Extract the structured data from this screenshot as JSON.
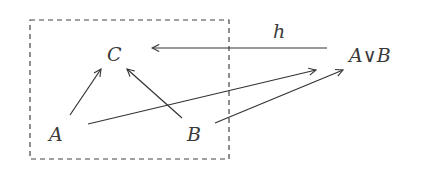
{
  "diagram": {
    "type": "commutative-diagram",
    "nodes": [
      {
        "id": "C",
        "label": "C",
        "x": 116,
        "y": 61
      },
      {
        "id": "A",
        "label": "A",
        "x": 57,
        "y": 140
      },
      {
        "id": "B",
        "label": "B",
        "x": 195,
        "y": 140
      },
      {
        "id": "AorB",
        "label": "A∨B",
        "x": 372,
        "y": 62
      }
    ],
    "edges": [
      {
        "from": "A",
        "to": "C",
        "label": ""
      },
      {
        "from": "B",
        "to": "C",
        "label": ""
      },
      {
        "from": "A",
        "to": "AorB",
        "label": ""
      },
      {
        "from": "B",
        "to": "AorB",
        "label": ""
      },
      {
        "from": "AorB",
        "to": "C",
        "label": "h"
      }
    ],
    "edge_label_h": "h",
    "grouping_box": {
      "style": "dashed",
      "contains": [
        "A",
        "B",
        "C"
      ]
    }
  }
}
